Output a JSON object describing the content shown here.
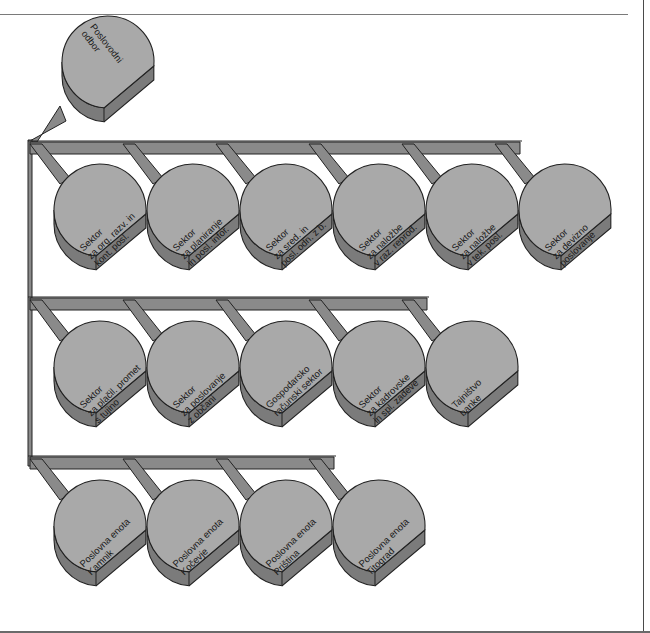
{
  "colors": {
    "top_face": "#a9a9a9",
    "side_face": "#7b7b7b",
    "bar_face": "#8a8a8a",
    "bar_edge": "#d8d8d8",
    "outline": "#222222",
    "background": "#ffffff"
  },
  "root": {
    "name": "poslovodni-odbor",
    "label": "Poslovodni\nodbor",
    "cx": 108,
    "cy": 62
  },
  "rows": [
    {
      "bus_y": 142,
      "nodes": [
        {
          "name": "sektor-org-razv",
          "label": "Sektor\nza org. razv. in\nkont. posl.",
          "cx": 100
        },
        {
          "name": "sektor-planiranje",
          "label": "Sektor\nza planiranje\nin posl. infor.",
          "cx": 193
        },
        {
          "name": "sektor-sred-posl-odn",
          "label": "Sektor\nza sred. in\nposl. odn. z b.",
          "cx": 286
        },
        {
          "name": "sektor-nalozbe-raz-reprod",
          "label": "Sektor\nza naložbe\nv raz. reprod.",
          "cx": 379
        },
        {
          "name": "sektor-nalozbe-tek-posl",
          "label": "Sektor\nza naložbe\nv tek. posl.",
          "cx": 472
        },
        {
          "name": "sektor-devizno-poslovanje",
          "label": "Sektor\nza devizno\nposlovanje",
          "cx": 565
        }
      ],
      "cy": 210
    },
    {
      "bus_y": 298,
      "nodes": [
        {
          "name": "sektor-placil-promet",
          "label": "Sektor\nza plačil. promet\ns tujino",
          "cx": 100
        },
        {
          "name": "sektor-poslovanje-obcani",
          "label": "Sektor\nza poslovanje\nz občani",
          "cx": 193
        },
        {
          "name": "gospodarsko-racunski-sektor",
          "label": "Gospodarsko\nračunski sektor",
          "cx": 286
        },
        {
          "name": "sektor-kadrovske-zadeve",
          "label": "Sektor\nza kadrovske\nin spl. zadeve",
          "cx": 379
        },
        {
          "name": "tajnistvo-banke",
          "label": "Tajništvo\nbanke",
          "cx": 472
        }
      ],
      "cy": 367
    },
    {
      "bus_y": 457,
      "nodes": [
        {
          "name": "poslovna-enota-kamnik",
          "label": "Poslovna enota\nKamnik",
          "cx": 100
        },
        {
          "name": "poslovna-enota-kocevje",
          "label": "Poslovna enota\nKočevje",
          "cx": 193
        },
        {
          "name": "poslovna-enota-pristina",
          "label": "Poslovna enota\nPriština",
          "cx": 286
        },
        {
          "name": "poslovna-enota-titograd",
          "label": "Poslovna enota\nTitograd",
          "cx": 379
        }
      ],
      "cy": 526
    }
  ]
}
